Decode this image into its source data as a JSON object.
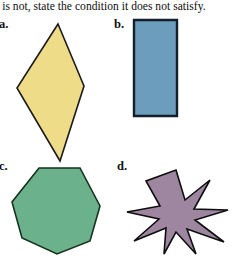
{
  "page": {
    "width": 233,
    "height": 257,
    "background": "#ffffff",
    "instruction_text": "t is not, state the condition it does not satisfy."
  },
  "items": [
    {
      "key": "a",
      "label": "a.",
      "shape_name": "rhombus",
      "fill": "#EFDC88",
      "stroke": "#1a1a1a",
      "stroke_width": 1.6,
      "sides": 4,
      "points": "48,6 74,68 50,143 7,70"
    },
    {
      "key": "b",
      "label": "b.",
      "shape_name": "rectangle",
      "fill": "#6D9DBC",
      "stroke": "#13202a",
      "stroke_width": 2.4,
      "sides": 4,
      "points": "3,3 46,3 46,99 3,99"
    },
    {
      "key": "c",
      "label": "c.",
      "shape_name": "heptagon",
      "fill": "#6BB18C",
      "stroke": "#17321f",
      "stroke_width": 1.6,
      "sides": 7,
      "points": "29,2 70,2 90,40 80,75 47,88 12,72 2,36"
    },
    {
      "key": "d",
      "label": "d.",
      "shape_name": "eight-pointed-star",
      "fill": "#9E86A0",
      "stroke": "#0e0e0e",
      "stroke_width": 1.6,
      "sides": 16,
      "points": "52,2 61,32 86,12 70,41 104,42 71,52 100,74 63,61 72,86 52,64 40,86 42,60 10,73 35,51 3,44 36,38 22,13"
    }
  ],
  "colors": {
    "yellow": "#EFDC88",
    "blue": "#6D9DBC",
    "green": "#6BB18C",
    "purple": "#9E86A0",
    "outline": "#1a1a1a",
    "text": "#0d0d0d"
  }
}
